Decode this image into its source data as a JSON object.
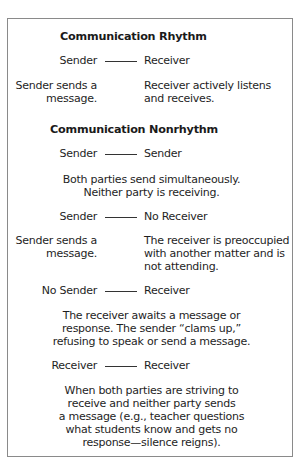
{
  "sections": [
    {
      "title": "Communication Rhythm",
      "pairs": [
        {
          "left": "Sender",
          "right": "Receiver",
          "left_desc": [
            "Sender sends a",
            "message."
          ],
          "right_desc": [
            "Receiver actively listens",
            "and receives."
          ]
        }
      ]
    },
    {
      "title": "Communication Nonrhythm",
      "pairs": [
        {
          "left": "Sender",
          "right": "Sender",
          "desc": [
            "Both parties send simultaneously.",
            "Neither party is receiving."
          ]
        },
        {
          "left": "Sender",
          "right": "No Receiver",
          "left_desc": [
            "Sender sends a",
            "message."
          ],
          "right_desc": [
            "The receiver is preoccupied",
            "with another matter and is",
            "not attending."
          ]
        },
        {
          "left": "No Sender",
          "right": "Receiver",
          "desc": [
            "The receiver awaits a message or",
            "response. The sender “clams up,”",
            "refusing to speak or send a message."
          ]
        },
        {
          "left": "Receiver",
          "right": "Receiver",
          "desc": [
            "When both parties are striving to",
            "receive and neither party sends",
            "a message (e.g., teacher questions",
            "what students know and gets no",
            "response—silence reigns)."
          ]
        }
      ]
    }
  ]
}
